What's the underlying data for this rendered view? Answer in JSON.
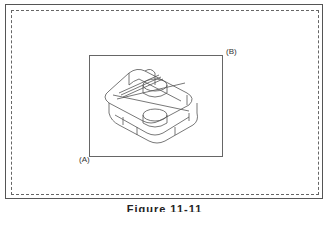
{
  "figure": {
    "labels": {
      "a": "(A)",
      "b": "(B)"
    },
    "caption": "Figure 11-11"
  },
  "icons": {
    "drawing": "isometric-wireframe-part"
  },
  "colors": {
    "line": "#555555",
    "background": "#ffffff"
  }
}
